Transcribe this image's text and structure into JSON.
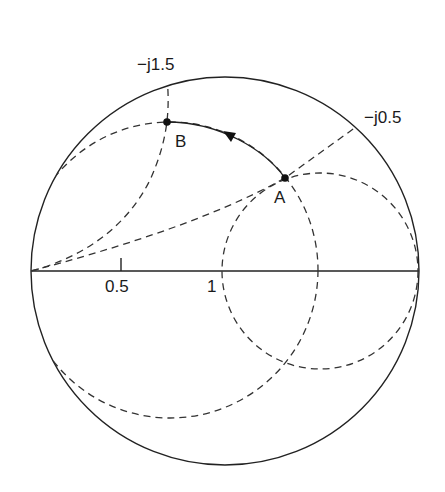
{
  "diagram": {
    "chart_circle": {
      "cx": 225,
      "cy": 271,
      "r": 194
    },
    "axis": {
      "x1": 31,
      "y1": 271,
      "x2": 419,
      "y2": 271
    },
    "labels": {
      "reactance_top": "−j1.5",
      "reactance_right": "−j0.5",
      "resistance_half": "0.5",
      "resistance_one": "1",
      "point_a": "A",
      "point_b": "B"
    },
    "points": {
      "A": {
        "x": 285,
        "y": 178
      },
      "B": {
        "x": 167,
        "y": 122
      }
    },
    "dashed_circles": [
      {
        "name": "r-equals-1-circle",
        "cx": 320,
        "cy": 271,
        "r": 98
      },
      {
        "name": "constant-swr-circle",
        "cx": 170,
        "cy": 270,
        "r": 148
      }
    ],
    "dashed_arcs": [
      {
        "name": "reactance-1.5-arc",
        "description": "from chart top through B to left end of axis"
      },
      {
        "name": "reactance-0.5-line",
        "description": "from left end of axis through A to chart border"
      }
    ],
    "path": {
      "from": "A",
      "to": "B",
      "direction": "counter-clockwise arrow"
    },
    "colors": {
      "line": "#222222",
      "dash": "#333333",
      "background": "#ffffff"
    }
  }
}
